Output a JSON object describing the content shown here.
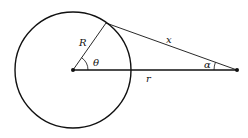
{
  "diagram": {
    "labels": {
      "R": "R",
      "theta": "θ",
      "x": "x",
      "alpha": "α",
      "r": "r"
    },
    "geometry": {
      "center": [
        73,
        70
      ],
      "radius": 58,
      "tangent_point": [
        106,
        23
      ],
      "external_point": [
        237,
        70
      ]
    },
    "colors": {
      "stroke": "#111111",
      "background": "#ffffff"
    }
  }
}
